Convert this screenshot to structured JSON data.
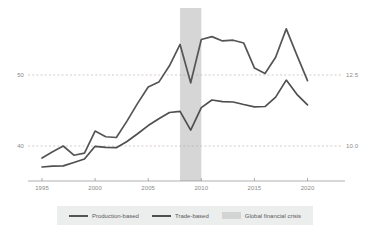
{
  "chart_data": {
    "type": "line",
    "title": "",
    "subtitle": "",
    "xlabel": "",
    "ylabel": "",
    "y2label": "",
    "grid": true,
    "gridlines_style": "dashed",
    "legend_position": "bottom",
    "xlim": [
      1994,
      2021
    ],
    "x_ticks": [
      "1995",
      "2000",
      "2005",
      "2010",
      "2015",
      "2020"
    ],
    "x_tick_values": [
      1995,
      2000,
      2005,
      2010,
      2015,
      2020
    ],
    "ylim_left": [
      33.5,
      58.0
    ],
    "y_ticks_left": [
      "40",
      "50"
    ],
    "y_tick_values_left": [
      40,
      50
    ],
    "ylim_right": [
      9.15,
      9.95
    ],
    "y_ticks_right": [
      "10.0",
      "12.5"
    ],
    "y_tick_values_right": [
      10.0,
      12.5
    ],
    "x": [
      1995,
      1996,
      1997,
      1998,
      1999,
      2000,
      2001,
      2002,
      2003,
      2004,
      2005,
      2006,
      2007,
      2008,
      2009,
      2010,
      2011,
      2012,
      2013,
      2014,
      2015,
      2016,
      2017,
      2018,
      2019,
      2020
    ],
    "series": [
      {
        "name": "Production-based",
        "axis": "left",
        "color": "#555555",
        "values": [
          38.3,
          39.2,
          40.0,
          38.7,
          39.0,
          42.1,
          41.3,
          41.2,
          43.5,
          46.0,
          48.3,
          49.0,
          51.3,
          54.3,
          48.9,
          55.0,
          55.4,
          54.8,
          54.9,
          54.5,
          51.0,
          50.2,
          52.5,
          56.5,
          52.8,
          49.2
        ]
      },
      {
        "name": "Trade-based",
        "axis": "right",
        "color": "#4f4f4f",
        "values": [
          9.26,
          9.29,
          9.3,
          9.42,
          9.54,
          9.99,
          9.95,
          9.94,
          10.16,
          10.43,
          10.72,
          10.96,
          11.18,
          11.22,
          10.56,
          11.35,
          11.62,
          11.56,
          11.55,
          11.46,
          11.38,
          11.39,
          11.72,
          12.32,
          11.82,
          11.45
        ]
      }
    ],
    "shaded_region": {
      "name": "Global financial crisis",
      "x_start": 2008,
      "x_end": 2010,
      "color": "#cfcfcf"
    }
  },
  "legend": {
    "items": [
      {
        "label": "Production-based",
        "marker": "line"
      },
      {
        "label": "Trade-based",
        "marker": "line"
      },
      {
        "label": "Global financial crisis",
        "marker": "swatch"
      }
    ]
  },
  "caption": {
    "text": ""
  }
}
